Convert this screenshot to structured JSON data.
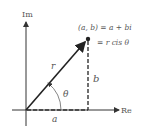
{
  "diagram": {
    "axes": {
      "vertical_label": "Im",
      "horizontal_label": "Re"
    },
    "vector_label": "r",
    "angle_label": "θ",
    "real_part_label": "a",
    "imag_part_label": "b",
    "point_equation_line1": "(a, b) = a + bi",
    "point_equation_line2": "= r cis θ",
    "colors": {
      "axis": "#333333",
      "vector": "#222222",
      "text": "#555555",
      "arc": "#666666"
    }
  }
}
